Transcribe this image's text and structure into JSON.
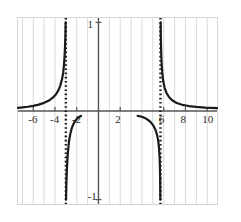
{
  "chart_data": {
    "type": "line",
    "title": "",
    "xlabel": "",
    "ylabel": "",
    "xlim": [
      -7.4,
      10.9
    ],
    "ylim": [
      -1.05,
      1.05
    ],
    "grid": true,
    "grid_axis": "x",
    "grid_spacing": 1,
    "legend": "none",
    "x_tick_labels": [
      "-6",
      "-4",
      "-2",
      "2",
      "6",
      "8",
      "10"
    ],
    "x_tick_values": [
      -6,
      -4,
      -2,
      2,
      6,
      8,
      10
    ],
    "y_tick_labels": [
      "1",
      "-1"
    ],
    "y_tick_values": [
      1,
      -1
    ],
    "asymptotes": {
      "vertical": [
        -3.0,
        5.7
      ],
      "horizontal": [
        0
      ],
      "style": "dotted"
    },
    "series": [
      {
        "name": "branch-upper-left",
        "comment": "approaches y=0 from above on the far left, rises to +infinity at x=-3",
        "points": [
          [
            -7.4,
            0.035
          ],
          [
            -7.0,
            0.04
          ],
          [
            -6.5,
            0.048
          ],
          [
            -6.0,
            0.058
          ],
          [
            -5.5,
            0.072
          ],
          [
            -5.0,
            0.092
          ],
          [
            -4.6,
            0.115
          ],
          [
            -4.2,
            0.15
          ],
          [
            -3.9,
            0.19
          ],
          [
            -3.7,
            0.23
          ],
          [
            -3.5,
            0.29
          ],
          [
            -3.35,
            0.36
          ],
          [
            -3.25,
            0.43
          ],
          [
            -3.18,
            0.51
          ],
          [
            -3.12,
            0.61
          ],
          [
            -3.08,
            0.71
          ],
          [
            -3.05,
            0.82
          ],
          [
            -3.03,
            0.92
          ],
          [
            -3.02,
            1.0
          ]
        ]
      },
      {
        "name": "branch-lower-middle-left",
        "comment": "drops to -infinity just right of x=-3, rises toward y=0 near x=-1.6",
        "points": [
          [
            -2.98,
            -1.0
          ],
          [
            -2.97,
            -0.92
          ],
          [
            -2.95,
            -0.82
          ],
          [
            -2.92,
            -0.71
          ],
          [
            -2.88,
            -0.6
          ],
          [
            -2.83,
            -0.5
          ],
          [
            -2.77,
            -0.41
          ],
          [
            -2.7,
            -0.335
          ],
          [
            -2.6,
            -0.265
          ],
          [
            -2.48,
            -0.205
          ],
          [
            -2.35,
            -0.16
          ],
          [
            -2.2,
            -0.122
          ],
          [
            -2.0,
            -0.09
          ],
          [
            -1.85,
            -0.072
          ],
          [
            -1.7,
            -0.06
          ],
          [
            -1.6,
            -0.055
          ]
        ]
      },
      {
        "name": "branch-lower-middle-right",
        "comment": "from y=0 near x=3.6 falls to -infinity at x=5.7",
        "points": [
          [
            3.6,
            -0.055
          ],
          [
            3.9,
            -0.062
          ],
          [
            4.2,
            -0.075
          ],
          [
            4.5,
            -0.095
          ],
          [
            4.8,
            -0.125
          ],
          [
            5.05,
            -0.165
          ],
          [
            5.25,
            -0.215
          ],
          [
            5.4,
            -0.275
          ],
          [
            5.5,
            -0.34
          ],
          [
            5.57,
            -0.42
          ],
          [
            5.62,
            -0.52
          ],
          [
            5.65,
            -0.63
          ],
          [
            5.67,
            -0.76
          ],
          [
            5.68,
            -0.88
          ],
          [
            5.69,
            -1.0
          ]
        ]
      },
      {
        "name": "branch-upper-right",
        "comment": "comes down from +infinity at x=5.7 and flattens toward y=0",
        "points": [
          [
            5.72,
            1.0
          ],
          [
            5.73,
            0.88
          ],
          [
            5.75,
            0.75
          ],
          [
            5.78,
            0.62
          ],
          [
            5.82,
            0.51
          ],
          [
            5.88,
            0.415
          ],
          [
            5.96,
            0.335
          ],
          [
            6.08,
            0.265
          ],
          [
            6.25,
            0.205
          ],
          [
            6.5,
            0.155
          ],
          [
            6.8,
            0.118
          ],
          [
            7.2,
            0.09
          ],
          [
            7.7,
            0.07
          ],
          [
            8.3,
            0.056
          ],
          [
            9.0,
            0.046
          ],
          [
            9.8,
            0.039
          ],
          [
            10.9,
            0.033
          ]
        ]
      }
    ],
    "colors": {
      "curve": "#1a1a1a",
      "asymptote": "#1a1a1a",
      "axis": "#555555",
      "grid": "#d9d9d9",
      "frame": "#d4d4d4",
      "background": "#ffffff",
      "tick_text": "#2b2b2b"
    }
  }
}
